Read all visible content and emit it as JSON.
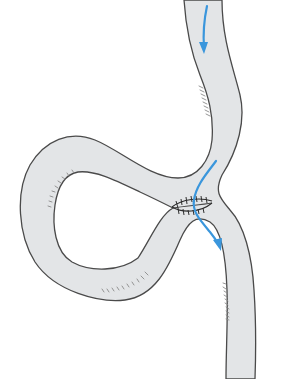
{
  "figure": {
    "colors": {
      "bowel_fill": "#e3e5e7",
      "outline": "#4a4a4a",
      "flow_arrow": "#3a96dc",
      "suture": "#2e2e2e",
      "background": "#ffffff"
    },
    "arrows": [
      {
        "name": "inflow-arrow",
        "direction": "down",
        "location": "upper limb"
      },
      {
        "name": "anastomosis-flow-arrow",
        "direction": "down-right",
        "location": "through anastomosis into lower limb"
      }
    ],
    "labels": []
  }
}
